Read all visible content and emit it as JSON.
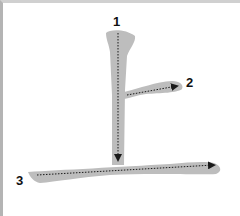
{
  "character": "上",
  "diagram_type": "stroke-order",
  "colors": {
    "stroke_fill": "#bdbdbd",
    "arrow": "#1a1a1a",
    "border": "#b4b4b4",
    "background": "#ffffff"
  },
  "strokes": [
    {
      "number": "1",
      "direction": "down",
      "label": "1"
    },
    {
      "number": "2",
      "direction": "right",
      "label": "2"
    },
    {
      "number": "3",
      "direction": "right",
      "label": "3"
    }
  ]
}
